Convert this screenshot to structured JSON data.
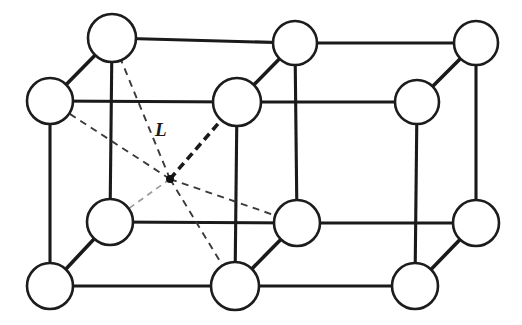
{
  "figure": {
    "background_color": "#ffffff",
    "line_color": "#1a1a1a",
    "dash_color": "#3a3a3a",
    "atom_fill": "#ffffff",
    "width": 522,
    "height": 325
  },
  "labels": {
    "interstitial_distance": "L"
  },
  "label_positions": {
    "interstitial_distance": {
      "x": 155,
      "y": 136
    }
  },
  "atoms": [
    {
      "id": "back-top-left",
      "cx": 112,
      "cy": 38,
      "r": 24
    },
    {
      "id": "back-top-mid",
      "cx": 295,
      "cy": 43,
      "r": 22
    },
    {
      "id": "back-top-right",
      "cx": 476,
      "cy": 43,
      "r": 22
    },
    {
      "id": "front-top-left",
      "cx": 50,
      "cy": 101,
      "r": 23
    },
    {
      "id": "front-top-mid",
      "cx": 237,
      "cy": 102,
      "r": 24
    },
    {
      "id": "front-top-right",
      "cx": 417,
      "cy": 102,
      "r": 22
    },
    {
      "id": "back-bottom-left",
      "cx": 110,
      "cy": 222,
      "r": 23
    },
    {
      "id": "back-bottom-mid",
      "cx": 297,
      "cy": 223,
      "r": 23
    },
    {
      "id": "back-bottom-right",
      "cx": 476,
      "cy": 223,
      "r": 23
    },
    {
      "id": "front-bottom-left",
      "cx": 50,
      "cy": 286,
      "r": 23
    },
    {
      "id": "front-bottom-mid",
      "cx": 235,
      "cy": 286,
      "r": 24
    },
    {
      "id": "front-bottom-right",
      "cx": 415,
      "cy": 286,
      "r": 23
    }
  ],
  "interstitial_site": {
    "cx": 170,
    "cy": 179,
    "r": 4
  },
  "bonds": [
    {
      "id": "back-top-left--back-top-mid",
      "x1": 112,
      "y1": 38,
      "x2": 295,
      "y2": 43,
      "style": "solid"
    },
    {
      "id": "back-top-mid--back-top-right",
      "x1": 295,
      "y1": 43,
      "x2": 476,
      "y2": 43,
      "style": "solid"
    },
    {
      "id": "front-top-left--front-top-mid",
      "x1": 50,
      "y1": 101,
      "x2": 237,
      "y2": 102,
      "style": "solid"
    },
    {
      "id": "front-top-mid--front-top-right",
      "x1": 237,
      "y1": 102,
      "x2": 417,
      "y2": 102,
      "style": "solid"
    },
    {
      "id": "back-bottom-left--back-bottom-mid",
      "x1": 110,
      "y1": 222,
      "x2": 297,
      "y2": 223,
      "style": "solid"
    },
    {
      "id": "back-bottom-mid--back-bottom-right",
      "x1": 297,
      "y1": 223,
      "x2": 476,
      "y2": 223,
      "style": "solid"
    },
    {
      "id": "front-bottom-left--front-bottom-mid",
      "x1": 50,
      "y1": 286,
      "x2": 235,
      "y2": 286,
      "style": "solid"
    },
    {
      "id": "front-bottom-mid--front-bottom-right",
      "x1": 235,
      "y1": 286,
      "x2": 415,
      "y2": 286,
      "style": "solid"
    },
    {
      "id": "back-top-left--back-bottom-left",
      "x1": 112,
      "y1": 38,
      "x2": 110,
      "y2": 222,
      "style": "solid"
    },
    {
      "id": "back-top-mid--back-bottom-mid",
      "x1": 295,
      "y1": 43,
      "x2": 297,
      "y2": 223,
      "style": "solid"
    },
    {
      "id": "back-top-right--back-bottom-right",
      "x1": 476,
      "y1": 43,
      "x2": 476,
      "y2": 223,
      "style": "solid"
    },
    {
      "id": "front-top-left--front-bottom-left",
      "x1": 50,
      "y1": 101,
      "x2": 50,
      "y2": 286,
      "style": "solid"
    },
    {
      "id": "front-top-mid--front-bottom-mid",
      "x1": 237,
      "y1": 102,
      "x2": 235,
      "y2": 286,
      "style": "solid"
    },
    {
      "id": "front-top-right--front-bottom-right",
      "x1": 417,
      "y1": 102,
      "x2": 415,
      "y2": 286,
      "style": "solid"
    },
    {
      "id": "front-top-left--back-top-left",
      "x1": 50,
      "y1": 101,
      "x2": 112,
      "y2": 38,
      "style": "diagonal"
    },
    {
      "id": "front-top-mid--back-top-mid",
      "x1": 237,
      "y1": 102,
      "x2": 295,
      "y2": 43,
      "style": "diagonal"
    },
    {
      "id": "front-top-right--back-top-right",
      "x1": 417,
      "y1": 102,
      "x2": 476,
      "y2": 43,
      "style": "diagonal"
    },
    {
      "id": "front-bottom-left--back-bottom-left",
      "x1": 50,
      "y1": 286,
      "x2": 110,
      "y2": 222,
      "style": "diagonal"
    },
    {
      "id": "front-bottom-mid--back-bottom-mid",
      "x1": 235,
      "y1": 286,
      "x2": 297,
      "y2": 223,
      "style": "diagonal"
    },
    {
      "id": "front-bottom-right--back-bottom-right",
      "x1": 415,
      "y1": 286,
      "x2": 476,
      "y2": 223,
      "style": "diagonal"
    }
  ],
  "interstitial_rays": [
    {
      "id": "ray-to-back-top-left",
      "x2": 112,
      "y2": 38,
      "style": "dashed"
    },
    {
      "id": "ray-to-front-top-left",
      "x2": 50,
      "y2": 101,
      "style": "dashed"
    },
    {
      "id": "ray-to-front-top-mid",
      "x2": 237,
      "y2": 102,
      "style": "dashed-bold"
    },
    {
      "id": "ray-to-back-bottom-left",
      "x2": 110,
      "y2": 222,
      "style": "dashed-faint"
    },
    {
      "id": "ray-to-front-bottom-mid",
      "x2": 235,
      "y2": 286,
      "style": "dashed"
    },
    {
      "id": "ray-to-back-bottom-mid",
      "x2": 297,
      "y2": 223,
      "style": "dashed"
    }
  ]
}
